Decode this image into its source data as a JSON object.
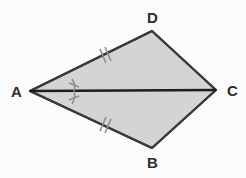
{
  "figure": {
    "name": "kite-abcd-with-diagonal",
    "shape_type": "kite",
    "background_color": "#fbfbfb",
    "fill_color": "#d4d4d4",
    "stroke_color": "#3a3a3a",
    "mark_color": "#8c8c8c",
    "diagonal_color": "#1e1e1e"
  },
  "vertices": [
    {
      "id": "A",
      "label": "A",
      "x": 30,
      "y": 91
    },
    {
      "id": "D",
      "label": "D",
      "x": 152,
      "y": 31
    },
    {
      "id": "C",
      "label": "C",
      "x": 216,
      "y": 90
    },
    {
      "id": "B",
      "label": "B",
      "x": 152,
      "y": 148
    }
  ],
  "polygon": {
    "points": "30,91 152,31 216,90 152,148",
    "order": [
      "A",
      "D",
      "C",
      "B"
    ]
  },
  "segments": [
    {
      "id": "AD",
      "from": "A",
      "to": "D",
      "tick_marks": 2
    },
    {
      "id": "DC",
      "from": "D",
      "to": "C",
      "tick_marks": 0
    },
    {
      "id": "CB",
      "from": "C",
      "to": "B",
      "tick_marks": 0
    },
    {
      "id": "BA",
      "from": "B",
      "to": "A",
      "tick_marks": 2
    },
    {
      "id": "AC",
      "from": "A",
      "to": "C",
      "tick_marks": 0,
      "is_diagonal": true
    }
  ],
  "angle_marks": [
    {
      "id": "angle-DAC",
      "at": "A",
      "between": [
        "AD",
        "AC"
      ],
      "tick_marks": 1
    },
    {
      "id": "angle-CAB",
      "at": "A",
      "between": [
        "AC",
        "AB"
      ],
      "tick_marks": 1
    }
  ]
}
